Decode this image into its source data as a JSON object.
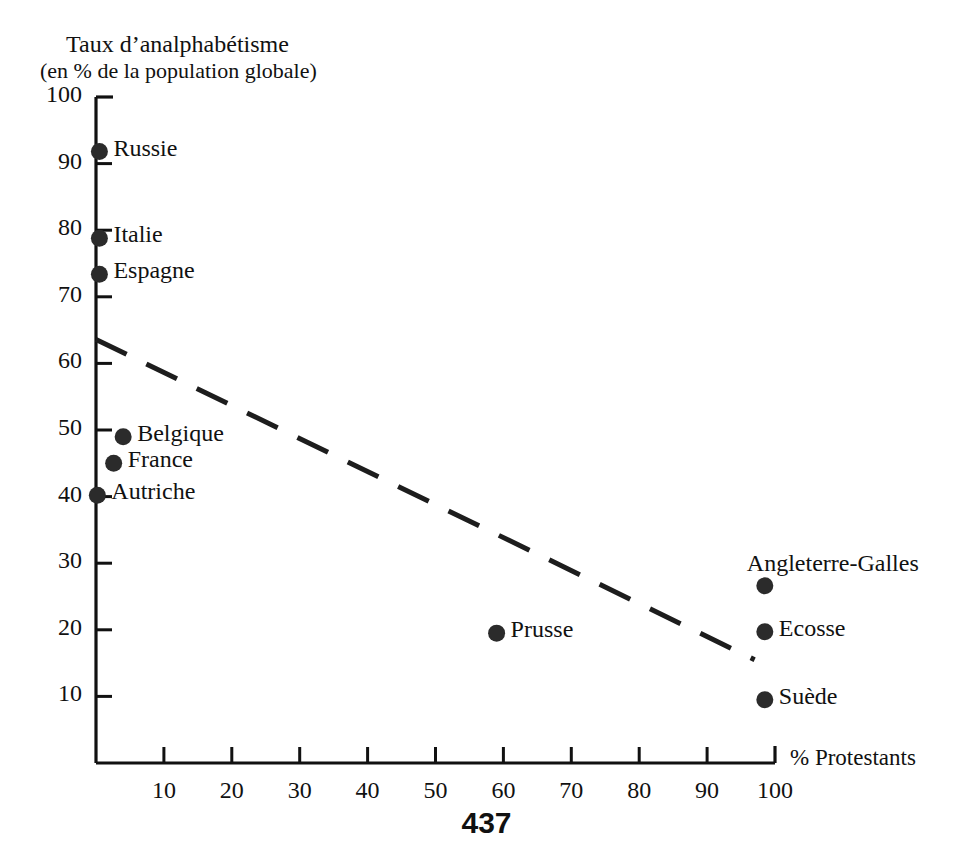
{
  "chart_data": {
    "type": "scatter",
    "title": "Taux d’analphabétisme",
    "subtitle": "(en % de la population globale)",
    "ylabel": "Taux d’analphabétisme (en % de la population globale)",
    "xlabel": "% Protestants",
    "xlim": [
      0,
      100
    ],
    "ylim": [
      0,
      100
    ],
    "grid": false,
    "legend": "none",
    "xticks": [
      10,
      20,
      30,
      40,
      50,
      60,
      70,
      80,
      90,
      100
    ],
    "yticks": [
      10,
      20,
      30,
      40,
      50,
      60,
      70,
      80,
      90,
      100
    ],
    "points": [
      {
        "label": "Russie",
        "x": 0.5,
        "y": 91.8,
        "label_pos": "right"
      },
      {
        "label": "Italie",
        "x": 0.5,
        "y": 78.8,
        "label_pos": "right"
      },
      {
        "label": "Espagne",
        "x": 0.5,
        "y": 73.4,
        "label_pos": "right"
      },
      {
        "label": "Belgique",
        "x": 4.0,
        "y": 49.0,
        "label_pos": "right"
      },
      {
        "label": "France",
        "x": 2.6,
        "y": 45.0,
        "label_pos": "right"
      },
      {
        "label": "Autriche",
        "x": 0.2,
        "y": 40.2,
        "label_pos": "right"
      },
      {
        "label": "Angleterre-Galles",
        "x": 98.5,
        "y": 26.6,
        "label_pos": "above"
      },
      {
        "label": "Prusse",
        "x": 59.0,
        "y": 19.5,
        "label_pos": "right"
      },
      {
        "label": "Ecosse",
        "x": 98.5,
        "y": 19.7,
        "label_pos": "right"
      },
      {
        "label": "Suède",
        "x": 98.5,
        "y": 9.5,
        "label_pos": "right"
      }
    ],
    "trendline": {
      "style": "dashed",
      "x0": 0.0,
      "y0": 63.6,
      "x1": 97.0,
      "y1": 15.5
    },
    "colors": {
      "marker": "#2b2b2b",
      "axis": "#111111",
      "trendline": "#1d1d1d",
      "background": "#ffffff"
    }
  },
  "page": {
    "number": "437"
  }
}
